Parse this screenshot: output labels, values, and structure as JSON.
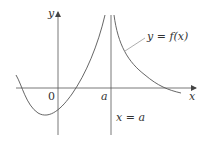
{
  "diagram": {
    "type": "function-graph-vertical-asymptote",
    "axes": {
      "x_label": "x",
      "y_label": "y",
      "origin_label": "0"
    },
    "tick_labels": {
      "a": "a"
    },
    "asymptote_label": "x = a",
    "curve_label": "y = f(x)",
    "colors": {
      "axis": "#444444",
      "curve": "#555555",
      "text": "#333333",
      "background": "#ffffff"
    }
  }
}
